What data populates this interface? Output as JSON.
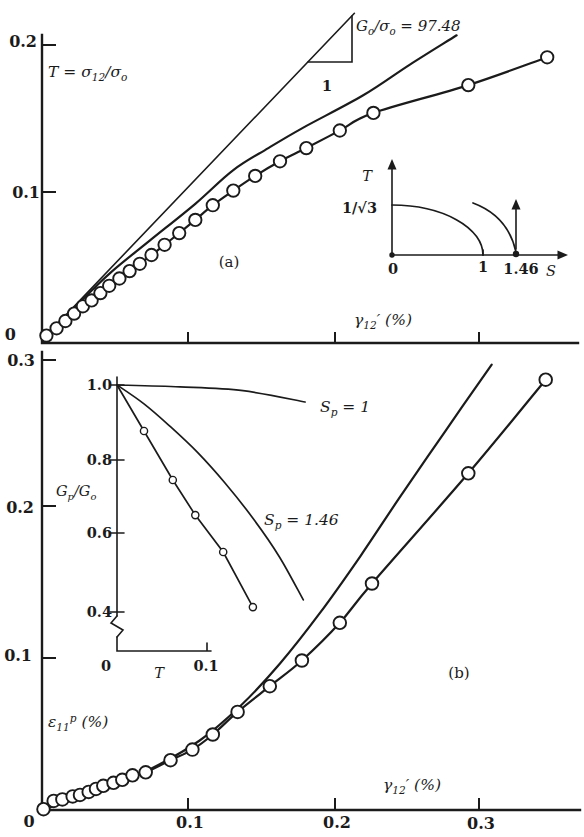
{
  "figure": {
    "background": "#ffffff",
    "ink": "#1b1b1b",
    "description_tags": [
      "(a)",
      "(b)"
    ]
  },
  "chart_data": [
    {
      "id": "a",
      "type": "scatter",
      "tag": "(a)",
      "xlabel_parts": [
        {
          "t": "γ"
        },
        {
          "t": "12",
          "s": "sub"
        },
        {
          "t": "′ (%)"
        }
      ],
      "ylabel_parts": [
        {
          "t": "T = σ"
        },
        {
          "t": "12",
          "s": "sub"
        },
        {
          "t": "/σ"
        },
        {
          "t": "o",
          "s": "sub"
        }
      ],
      "xlim": [
        0,
        0.37
      ],
      "ylim": [
        0,
        0.21
      ],
      "y_tick_labels": [
        "0.2",
        "0.1",
        "0"
      ],
      "y_tick_values": [
        0.2,
        0.1,
        0
      ],
      "x_tick_values": [
        0.1,
        0.2,
        0.3
      ],
      "slope_run_label": "1",
      "grid": false,
      "series": [
        {
          "name": "initial-slope-tangent",
          "label_parts": [
            {
              "t": "G"
            },
            {
              "t": "o",
              "s": "sub"
            },
            {
              "t": "/σ"
            },
            {
              "t": "o",
              "s": "sub"
            },
            {
              "t": " = 97.48"
            }
          ],
          "smooth": false,
          "points": [
            [
              0,
              0
            ],
            [
              0.214,
              0.223
            ]
          ]
        },
        {
          "name": "prediction-curve",
          "smooth": true,
          "points": [
            [
              0,
              0
            ],
            [
              0.023,
              0.023
            ],
            [
              0.047,
              0.046
            ],
            [
              0.074,
              0.068
            ],
            [
              0.105,
              0.093
            ],
            [
              0.131,
              0.116
            ],
            [
              0.155,
              0.131
            ],
            [
              0.179,
              0.145
            ],
            [
              0.22,
              0.167
            ],
            [
              0.252,
              0.188
            ],
            [
              0.284,
              0.208
            ]
          ]
        },
        {
          "name": "experiment",
          "smooth": true,
          "markers": true,
          "points": [
            [
              0.003,
              0.003
            ],
            [
              0.01,
              0.008
            ],
            [
              0.016,
              0.013
            ],
            [
              0.022,
              0.018
            ],
            [
              0.028,
              0.023
            ],
            [
              0.034,
              0.027
            ],
            [
              0.04,
              0.032
            ],
            [
              0.046,
              0.037
            ],
            [
              0.053,
              0.042
            ],
            [
              0.06,
              0.047
            ],
            [
              0.067,
              0.052
            ],
            [
              0.075,
              0.058
            ],
            [
              0.084,
              0.065
            ],
            [
              0.094,
              0.073
            ],
            [
              0.105,
              0.082
            ],
            [
              0.117,
              0.092
            ],
            [
              0.131,
              0.102
            ],
            [
              0.146,
              0.112
            ],
            [
              0.163,
              0.122
            ],
            [
              0.181,
              0.131
            ],
            [
              0.204,
              0.143
            ],
            [
              0.227,
              0.155
            ],
            [
              0.292,
              0.174
            ],
            [
              0.346,
              0.193
            ]
          ]
        }
      ],
      "inset": {
        "ylabel": "T",
        "y_value_label": "1/√3",
        "x_tick_labels": [
          "0",
          "1",
          "1.46"
        ],
        "xlabel": "S"
      }
    },
    {
      "id": "b",
      "type": "scatter",
      "tag": "(b)",
      "xlabel_parts": [
        {
          "t": "γ"
        },
        {
          "t": "12",
          "s": "sub"
        },
        {
          "t": "′ (%)"
        }
      ],
      "ylabel_parts": [
        {
          "t": "ε"
        },
        {
          "t": "11",
          "s": "sub"
        },
        {
          "t": "p",
          "s": "sup"
        },
        {
          "t": " (%)"
        }
      ],
      "xlim": [
        0,
        0.37
      ],
      "ylim": [
        0,
        0.3
      ],
      "y_tick_labels": [
        "0.3",
        "0.2",
        "0.1"
      ],
      "y_tick_values": [
        0.3,
        0.2,
        0.1
      ],
      "x_tick_labels": [
        "0",
        "0.1",
        "0.2",
        "0.3"
      ],
      "x_tick_values": [
        0,
        0.1,
        0.2,
        0.3
      ],
      "grid": false,
      "series": [
        {
          "name": "prediction-curve",
          "smooth": true,
          "points": [
            [
              0,
              0
            ],
            [
              0.04,
              0.013
            ],
            [
              0.074,
              0.027
            ],
            [
              0.108,
              0.046
            ],
            [
              0.136,
              0.069
            ],
            [
              0.163,
              0.097
            ],
            [
              0.19,
              0.13
            ],
            [
              0.218,
              0.168
            ],
            [
              0.245,
              0.207
            ],
            [
              0.277,
              0.252
            ],
            [
              0.308,
              0.295
            ]
          ]
        },
        {
          "name": "experiment",
          "smooth": true,
          "markers": true,
          "points": [
            [
              0.001,
              0.0005
            ],
            [
              0.008,
              0.006
            ],
            [
              0.014,
              0.007
            ],
            [
              0.021,
              0.009
            ],
            [
              0.026,
              0.01
            ],
            [
              0.032,
              0.012
            ],
            [
              0.037,
              0.014
            ],
            [
              0.042,
              0.016
            ],
            [
              0.049,
              0.018
            ],
            [
              0.055,
              0.02
            ],
            [
              0.062,
              0.023
            ],
            [
              0.071,
              0.025
            ],
            [
              0.088,
              0.033
            ],
            [
              0.103,
              0.04
            ],
            [
              0.117,
              0.05
            ],
            [
              0.134,
              0.065
            ],
            [
              0.156,
              0.082
            ],
            [
              0.178,
              0.099
            ],
            [
              0.204,
              0.124
            ],
            [
              0.226,
              0.15
            ],
            [
              0.292,
              0.223
            ],
            [
              0.345,
              0.285
            ]
          ]
        }
      ]
    },
    {
      "id": "b-inset",
      "type": "line",
      "xlabel": "T",
      "ylabel_parts": [
        {
          "t": "G"
        },
        {
          "t": "p",
          "s": "sub"
        },
        {
          "t": "/G"
        },
        {
          "t": "o",
          "s": "sub"
        }
      ],
      "xlim": [
        0,
        0.11
      ],
      "ylim": [
        0.4,
        1.0
      ],
      "axis_break": true,
      "y_tick_labels": [
        "1.0",
        "0.8",
        "0.6",
        "0.4"
      ],
      "y_tick_values": [
        1.0,
        0.8,
        0.6,
        0.4
      ],
      "x_tick_labels": [
        "0",
        "0.1"
      ],
      "x_tick_values": [
        0,
        0.1
      ],
      "series": [
        {
          "name": "sp-1",
          "label_parts": [
            {
              "t": "S"
            },
            {
              "t": "p",
              "s": "sub"
            },
            {
              "t": " = 1"
            }
          ],
          "smooth": true,
          "points": [
            [
              0,
              1.0
            ],
            [
              0.07,
              0.995
            ],
            [
              0.14,
              0.985
            ],
            [
              0.209,
              0.955
            ]
          ]
        },
        {
          "name": "sp-1.46",
          "label_parts": [
            {
              "t": "S"
            },
            {
              "t": "p",
              "s": "sub"
            },
            {
              "t": " = 1.46"
            }
          ],
          "smooth": true,
          "points": [
            [
              0,
              1.0
            ],
            [
              0.03,
              0.95
            ],
            [
              0.06,
              0.888
            ],
            [
              0.09,
              0.82
            ],
            [
              0.12,
              0.74
            ],
            [
              0.15,
              0.65
            ],
            [
              0.18,
              0.546
            ],
            [
              0.207,
              0.43
            ]
          ]
        },
        {
          "name": "experiment",
          "smooth": false,
          "markers": true,
          "marker_skip": 1,
          "points": [
            [
              0,
              1.0
            ],
            [
              0.03,
              0.878
            ],
            [
              0.062,
              0.748
            ],
            [
              0.087,
              0.655
            ],
            [
              0.118,
              0.557
            ],
            [
              0.151,
              0.411
            ]
          ]
        }
      ]
    }
  ]
}
